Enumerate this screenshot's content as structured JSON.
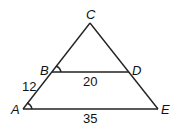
{
  "points": {
    "A": {
      "label": "A",
      "x": 23,
      "y": 109
    },
    "B": {
      "label": "B",
      "x": 52,
      "y": 72
    },
    "C": {
      "label": "C",
      "x": 90,
      "y": 23
    },
    "D": {
      "label": "D",
      "x": 129,
      "y": 72
    },
    "E": {
      "label": "E",
      "x": 158,
      "y": 109
    }
  },
  "measures": {
    "AB": "12",
    "BD": "20",
    "AE": "35"
  },
  "colors": {
    "stroke": "#222222",
    "text": "#111111"
  }
}
